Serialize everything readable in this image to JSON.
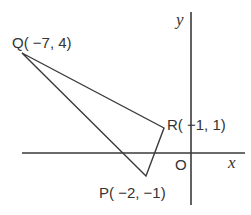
{
  "diagram": {
    "type": "coordinate-plane-triangle",
    "axes": {
      "x_label": "x",
      "y_label": "y",
      "origin_label": "O"
    },
    "points": [
      {
        "name": "Q",
        "label": "Q( −7, 4)",
        "x": -7,
        "y": 4
      },
      {
        "name": "R",
        "label": "R( −1, 1)",
        "x": -1,
        "y": 1
      },
      {
        "name": "P",
        "label": "P( −2, −1)",
        "x": -2,
        "y": -1
      }
    ],
    "triangle": [
      "Q",
      "R",
      "P"
    ],
    "colors": {
      "line": "#3a3a3a",
      "text": "#333333",
      "background": "#ffffff"
    }
  }
}
